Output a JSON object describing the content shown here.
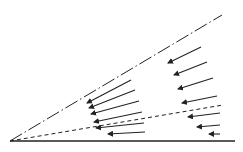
{
  "diagram": {
    "background": "#ffffff",
    "stroke_color": "#222222",
    "origin": [
      10,
      141
    ],
    "lines": [
      {
        "name": "baseline",
        "style": "solid",
        "from": [
          10,
          141
        ],
        "to": [
          235,
          141
        ]
      },
      {
        "name": "upper-boundary",
        "style": "dash-dot",
        "from": [
          10,
          141
        ],
        "to": [
          222,
          15
        ]
      },
      {
        "name": "middle-boundary",
        "style": "dashed",
        "from": [
          10,
          141
        ],
        "to": [
          223,
          105
        ]
      }
    ],
    "arrow_groups": [
      {
        "name": "left-group",
        "arrows": [
          {
            "from": [
              131,
              80
            ],
            "to": [
              87,
              103
            ]
          },
          {
            "from": [
              135,
              90
            ],
            "to": [
              89,
              108
            ]
          },
          {
            "from": [
              139,
              101
            ],
            "to": [
              91,
              114
            ]
          },
          {
            "from": [
              142,
              112
            ],
            "to": [
              94,
              122
            ]
          },
          {
            "from": [
              144,
              123
            ],
            "to": [
              96,
              128
            ]
          },
          {
            "from": [
              145,
              132
            ],
            "to": [
              108,
              134
            ]
          }
        ]
      },
      {
        "name": "right-group",
        "arrows": [
          {
            "from": [
              201,
              47
            ],
            "to": [
              168,
              63
            ]
          },
          {
            "from": [
              207,
              62
            ],
            "to": [
              174,
              75
            ]
          },
          {
            "from": [
              213,
              78
            ],
            "to": [
              178,
              89
            ]
          },
          {
            "from": [
              217,
              96
            ],
            "to": [
              182,
              103
            ]
          },
          {
            "from": [
              220,
              113
            ],
            "to": [
              188,
              117
            ]
          },
          {
            "from": [
              220,
              125
            ],
            "to": [
              197,
              127
            ]
          },
          {
            "from": [
              220,
              134
            ],
            "to": [
              209,
              134
            ]
          }
        ]
      }
    ]
  }
}
